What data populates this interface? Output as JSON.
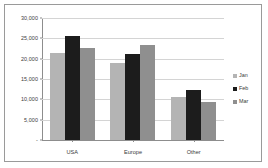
{
  "chart_data": {
    "type": "bar",
    "title": "",
    "xlabel": "",
    "ylabel": "",
    "categories": [
      "USA",
      "Europe",
      "Other"
    ],
    "series": [
      {
        "name": "Jan",
        "color": "#b4b4b4",
        "values": [
          21400,
          18900,
          10600
        ]
      },
      {
        "name": "Feb",
        "color": "#1c1c1c",
        "values": [
          25700,
          21100,
          12300
        ]
      },
      {
        "name": "Mar",
        "color": "#8f8f8f",
        "values": [
          22600,
          23300,
          9300
        ]
      }
    ],
    "ylim": [
      0,
      30000
    ],
    "ytick_values": [
      0,
      5000,
      10000,
      15000,
      20000,
      25000,
      30000
    ],
    "ytick_labels": [
      "-",
      "5,000",
      "10,000",
      "15,000",
      "20,000",
      "25,000",
      "30,000"
    ],
    "grid": true,
    "legend_position": "right",
    "border_color": "#9a9a9a",
    "gridline_color": "#d4d4d4",
    "axis_color": "#8d8d8d",
    "plot_background": "#ffffff"
  }
}
